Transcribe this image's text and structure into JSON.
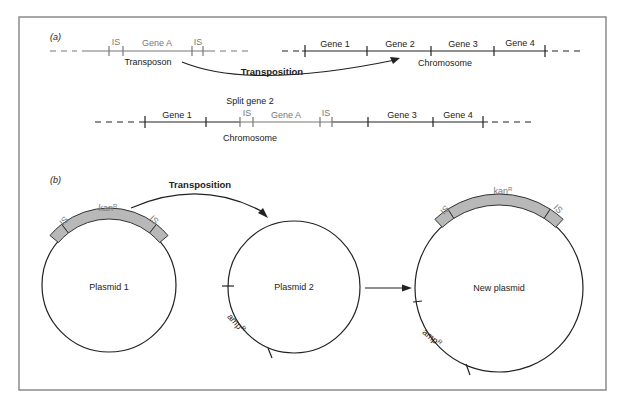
{
  "panels": {
    "a": "(a)",
    "b": "(b)"
  },
  "panel_a": {
    "transposon": {
      "caption": "Transposon",
      "is_left": "IS",
      "gene": "Gene A",
      "is_right": "IS"
    },
    "chromosome": {
      "caption": "Chromosome",
      "genes": [
        "Gene 1",
        "Gene 2",
        "Gene 3",
        "Gene 4"
      ]
    },
    "arrow_label": "Transposition",
    "result": {
      "caption_top": "Split gene 2",
      "caption_bottom": "Chromosome",
      "segments": [
        "Gene 1",
        "IS",
        "Gene A",
        "IS",
        "Gene 3",
        "Gene 4"
      ]
    }
  },
  "panel_b": {
    "arrow_label": "Transposition",
    "plasmid1": {
      "name": "Plasmid 1",
      "marker": "kan",
      "marker_sup": "R",
      "is_left": "IS",
      "is_right": "IS"
    },
    "plasmid2": {
      "name": "Plasmid 2",
      "marker": "amp",
      "marker_sup": "R"
    },
    "new_plasmid": {
      "name": "New plasmid",
      "marker_top": "kan",
      "marker_top_sup": "R",
      "is_left": "IS",
      "is_right": "IS",
      "marker_bottom": "amp",
      "marker_bottom_sup": "R"
    }
  },
  "colors": {
    "ink": "#222222",
    "transposon_gray": "#777777",
    "band_fill": "#b8b8b8",
    "frame": "#8a8a8a"
  }
}
